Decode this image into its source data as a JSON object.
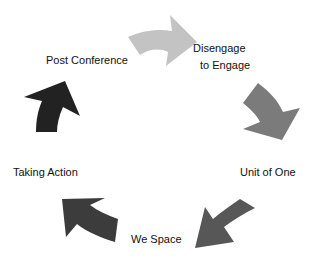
{
  "diagram": {
    "type": "cycle",
    "stages": [
      {
        "label": "Post Conference"
      },
      {
        "label_line1": "Disengage",
        "label_line2": "to Engage"
      },
      {
        "label": "Unit of One"
      },
      {
        "label": "We Space"
      },
      {
        "label": "Taking Action"
      }
    ],
    "arrows": [
      {
        "from": "Post Conference",
        "to": "Disengage to Engage",
        "color": "#c3c3c3"
      },
      {
        "from": "Disengage to Engage",
        "to": "Unit of One",
        "color": "#7b7b7b"
      },
      {
        "from": "Unit of One",
        "to": "We Space",
        "color": "#575757"
      },
      {
        "from": "We Space",
        "to": "Taking Action",
        "color": "#3c3c3c"
      },
      {
        "from": "Taking Action",
        "to": "Post Conference",
        "color": "#222222"
      }
    ]
  }
}
